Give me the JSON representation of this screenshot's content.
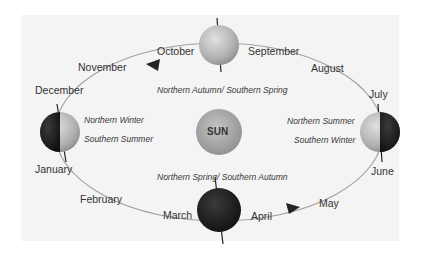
{
  "diagram": {
    "center": {
      "label": "SUN",
      "color": "#a8a8a8"
    },
    "months": [
      {
        "name": "October",
        "x": 157,
        "y": 45
      },
      {
        "name": "September",
        "x": 248,
        "y": 45
      },
      {
        "name": "November",
        "x": 78,
        "y": 61
      },
      {
        "name": "August",
        "x": 311,
        "y": 62
      },
      {
        "name": "December",
        "x": 35,
        "y": 84
      },
      {
        "name": "July",
        "x": 369,
        "y": 88
      },
      {
        "name": "January",
        "x": 35,
        "y": 163
      },
      {
        "name": "June",
        "x": 371,
        "y": 165
      },
      {
        "name": "February",
        "x": 80,
        "y": 193
      },
      {
        "name": "May",
        "x": 319,
        "y": 197
      },
      {
        "name": "March",
        "x": 163,
        "y": 209
      },
      {
        "name": "April",
        "x": 251,
        "y": 210
      }
    ],
    "seasons": {
      "top": "Northern Autumn/ Southern Spring",
      "bottom": "Northern Spring/ Southern Autumn",
      "left_1": "Northern Winter",
      "left_2": "Southern Summer",
      "right_1": "Northern Summer",
      "right_2": "Southern Winter"
    },
    "colors": {
      "panel": "#f4f4f4",
      "orbit": "#9a9a9a",
      "dark": "#1e1e1e",
      "light": "#b8b8b8"
    }
  }
}
